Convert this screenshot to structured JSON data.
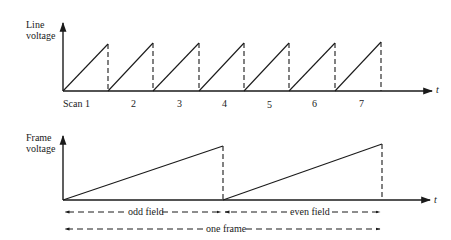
{
  "top_chart": {
    "ylabel_line1": "Line",
    "ylabel_line2": "voltage",
    "xlabel": "t",
    "scan_labels": [
      "Scan 1",
      "2",
      "3",
      "4",
      "5",
      "6",
      "7"
    ],
    "waveform": "sawtooth",
    "periods": 7
  },
  "bottom_chart": {
    "ylabel_line1": "Frame",
    "ylabel_line2": "voltage",
    "xlabel": "t",
    "waveform": "sawtooth",
    "periods": 2,
    "odd_field_label": "odd field",
    "even_field_label": "even field",
    "one_frame_label": "one frame"
  },
  "colors": {
    "ink": "#1a1a1a",
    "background": "#ffffff"
  }
}
